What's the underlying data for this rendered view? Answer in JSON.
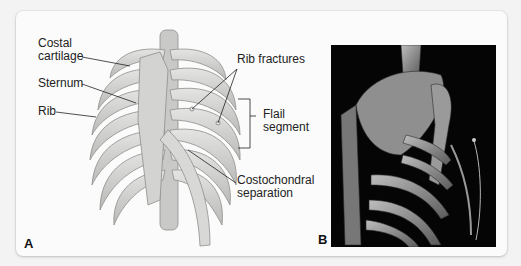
{
  "figure": {
    "panel_a": {
      "letter": "A",
      "labels": {
        "costal_cartilage": "Costal\ncartilage",
        "sternum": "Sternum",
        "rib": "Rib",
        "rib_fractures": "Rib fractures",
        "flail_segment": "Flail\nsegment",
        "costochondral_separation": "Costochondral\nseparation"
      }
    },
    "panel_b": {
      "letter": "B"
    }
  }
}
